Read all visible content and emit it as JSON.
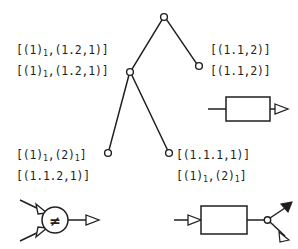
{
  "figure": {
    "background_color": "#ffffff",
    "stroke_color": "#1f1f1f"
  },
  "labels": {
    "top_left": {
      "name": "top-left-label",
      "lines": [
        [
          {
            "t": "[(1)"
          },
          {
            "t": "1",
            "sub": true
          },
          {
            "t": ",(1.2,1)]"
          }
        ],
        [
          {
            "t": "[(1)"
          },
          {
            "t": "1",
            "sub": true
          },
          {
            "t": ",(1.2,1)]"
          }
        ]
      ]
    },
    "top_right": {
      "name": "top-right-label",
      "lines": [
        [
          {
            "t": "[(1.1,2)]"
          }
        ],
        [
          {
            "t": "[(1.1,2)]"
          }
        ]
      ]
    },
    "bottom_left": {
      "name": "bottom-left-label",
      "lines": [
        [
          {
            "t": "[(1)"
          },
          {
            "t": "1",
            "sub": true
          },
          {
            "t": ",(2)"
          },
          {
            "t": "1",
            "sub": true
          },
          {
            "t": "]"
          }
        ],
        [
          {
            "t": "[(1.1.2,1)]"
          }
        ]
      ]
    },
    "bottom_right": {
      "name": "bottom-right-label",
      "lines": [
        [
          {
            "t": "[(1.1.1,1)]"
          }
        ],
        [
          {
            "t": "[(1)"
          },
          {
            "t": "1",
            "sub": true
          },
          {
            "t": ",(2)"
          },
          {
            "t": "1",
            "sub": true
          },
          {
            "t": "]"
          }
        ]
      ]
    }
  },
  "tree": {
    "name": "binary-tree-graph",
    "node_radius": 3.4,
    "nodes": [
      {
        "id": "root",
        "name": "tree-node-root",
        "x": 164,
        "y": 17
      },
      {
        "id": "internal",
        "name": "tree-node-internal",
        "x": 130,
        "y": 72
      },
      {
        "id": "leaf-right",
        "name": "tree-node-leaf-right",
        "x": 199,
        "y": 66
      },
      {
        "id": "leaf-bottom-left",
        "name": "tree-node-leaf-bottom-left",
        "x": 108,
        "y": 153
      },
      {
        "id": "leaf-bottom-right",
        "name": "tree-node-leaf-bottom-right",
        "x": 169,
        "y": 153
      }
    ],
    "edges": [
      {
        "from": "root",
        "to": "internal"
      },
      {
        "from": "root",
        "to": "leaf-right"
      },
      {
        "from": "internal",
        "to": "leaf-bottom-left"
      },
      {
        "from": "internal",
        "to": "leaf-bottom-right"
      }
    ]
  },
  "symbols": {
    "process_box_right": {
      "name": "process-box-symbol",
      "kind": "rectangle",
      "inputs": 1,
      "outputs": 1,
      "input_arrow": false,
      "output_arrow": true
    },
    "inequality_node": {
      "name": "inequality-comparator-symbol",
      "kind": "circle",
      "glyph": "≠",
      "inputs": 2,
      "outputs": 1
    },
    "fork_box": {
      "name": "fork-box-symbol",
      "kind": "rectangle",
      "inputs": 1,
      "outputs": 2,
      "junction": true
    }
  }
}
